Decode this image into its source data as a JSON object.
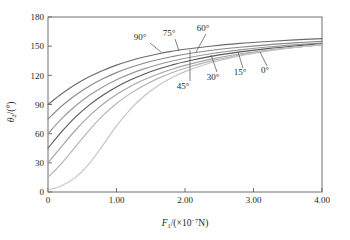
{
  "chart_data": {
    "type": "line",
    "title": "",
    "xlabel": "F1/(×10-7N)",
    "xlabel_parts": {
      "symbol": "F",
      "subscript": "1",
      "open": "/(× 10",
      "exponent": "−7",
      "close": "N)"
    },
    "ylabel": "θ2/(°)",
    "ylabel_parts": {
      "symbol": "θ",
      "subscript": "2",
      "unit": "/(°)"
    },
    "xlim": [
      0,
      4.0
    ],
    "ylim": [
      0,
      180
    ],
    "xticks": [
      "0",
      "1.00",
      "2.00",
      "3.00",
      "4.00"
    ],
    "xtick_values": [
      0,
      1.0,
      2.0,
      3.0,
      4.0
    ],
    "yticks": [
      "0",
      "30",
      "60",
      "90",
      "120",
      "150",
      "180"
    ],
    "ytick_values": [
      0,
      30,
      60,
      90,
      120,
      150,
      180
    ],
    "grid": false,
    "legend_position": "inline-annotations",
    "x": [
      0,
      0.2,
      0.4,
      0.6,
      0.8,
      1.0,
      1.2,
      1.4,
      1.6,
      1.8,
      2.0,
      2.4,
      2.8,
      3.2,
      3.6,
      4.0
    ],
    "series": [
      {
        "name": "90°",
        "label": "90°",
        "color": "#6b6b6b",
        "values": [
          90.0,
          101.0,
          110.5,
          118.5,
          125.0,
          130.5,
          135.0,
          138.8,
          142.0,
          144.6,
          146.8,
          150.2,
          152.8,
          154.8,
          156.4,
          157.8
        ]
      },
      {
        "name": "75°",
        "label": "75°",
        "color": "#8a8a8a",
        "values": [
          75.0,
          88.5,
          99.5,
          108.8,
          116.4,
          122.8,
          128.0,
          132.4,
          136.0,
          139.1,
          141.7,
          145.8,
          148.9,
          151.4,
          153.4,
          155.0
        ]
      },
      {
        "name": "60°",
        "label": "60°",
        "color": "#9a9a9a",
        "values": [
          60.0,
          75.5,
          88.5,
          99.2,
          108.0,
          115.4,
          121.5,
          126.6,
          130.9,
          134.5,
          137.6,
          142.5,
          146.2,
          149.1,
          151.4,
          153.3
        ]
      },
      {
        "name": "45°",
        "label": "45°",
        "color": "#5a5a5a",
        "values": [
          45.0,
          62.0,
          77.0,
          89.4,
          99.6,
          108.1,
          115.2,
          121.2,
          126.2,
          130.4,
          134.0,
          139.8,
          144.1,
          147.5,
          150.2,
          152.4
        ]
      },
      {
        "name": "30°",
        "label": "30°",
        "color": "#a5a5a5",
        "values": [
          30.0,
          47.0,
          63.5,
          78.0,
          90.2,
          100.2,
          108.5,
          115.4,
          121.2,
          126.0,
          130.2,
          136.9,
          141.9,
          145.8,
          148.9,
          151.4
        ]
      },
      {
        "name": "15°",
        "label": "15°",
        "color": "#b4b4b4",
        "values": [
          15.0,
          29.5,
          46.5,
          63.5,
          78.5,
          91.0,
          101.2,
          109.6,
          116.6,
          122.4,
          127.3,
          135.1,
          140.9,
          145.3,
          148.8,
          151.6
        ]
      },
      {
        "name": "0°",
        "label": "0°",
        "color": "#c4c4c4",
        "values": [
          2.0,
          6.5,
          15.0,
          29.0,
          48.0,
          68.0,
          85.0,
          98.5,
          109.0,
          117.2,
          123.8,
          133.4,
          140.0,
          144.9,
          148.7,
          151.8
        ]
      }
    ],
    "annotations": [
      {
        "text": "90°",
        "label_x": 140,
        "label_y": 40,
        "leader": [
          [
            150,
            43
          ],
          [
            161,
            52
          ]
        ]
      },
      {
        "text": "75°",
        "label_x": 169,
        "label_y": 36,
        "leader": [
          [
            175,
            39
          ],
          [
            179,
            51
          ]
        ]
      },
      {
        "text": "60°",
        "label_x": 203,
        "label_y": 31,
        "leader": [
          [
            206,
            34
          ],
          [
            196,
            52
          ]
        ]
      },
      {
        "text": "45°",
        "label_x": 183,
        "label_y": 89,
        "leader": [
          [
            190,
            81
          ],
          [
            190,
            50
          ]
        ]
      },
      {
        "text": "30°",
        "label_x": 213,
        "label_y": 80,
        "leader": [
          [
            217,
            72
          ],
          [
            211,
            55
          ]
        ]
      },
      {
        "text": "15°",
        "label_x": 240,
        "label_y": 75,
        "leader": [
          [
            243,
            68
          ],
          [
            238,
            52
          ]
        ]
      },
      {
        "text": "0°",
        "label_x": 265,
        "label_y": 73,
        "leader": [
          [
            267,
            66
          ],
          [
            260,
            52
          ]
        ]
      }
    ]
  },
  "figure": {
    "background_color": "#ffffff",
    "axis_color": "#6e6e6e",
    "text_color": "#231f20"
  }
}
